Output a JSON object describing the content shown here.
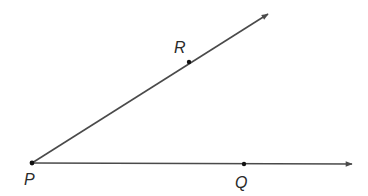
{
  "diagram": {
    "type": "angle",
    "colors": {
      "line": "#4a4a4a",
      "point": "#111111",
      "label": "#2a2a2a",
      "background": "#ffffff"
    },
    "vertex": {
      "name": "P",
      "label": "P",
      "x": 32,
      "y": 163
    },
    "points": [
      {
        "name": "R",
        "label": "R",
        "x": 189,
        "y": 62
      },
      {
        "name": "Q",
        "label": "Q",
        "x": 244,
        "y": 164
      }
    ],
    "rays": [
      {
        "name": "ray-PR",
        "from": "P",
        "through": "R",
        "end": {
          "x": 268,
          "y": 14
        }
      },
      {
        "name": "ray-PQ",
        "from": "P",
        "through": "Q",
        "end": {
          "x": 352,
          "y": 164
        }
      }
    ]
  }
}
